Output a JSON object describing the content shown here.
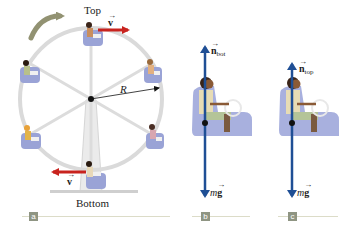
{
  "figure": {
    "panel_a": {
      "tag": "a",
      "top_label": "Top",
      "bottom_label": "Bottom",
      "radius_label": "R",
      "velocity_top_label": "v",
      "velocity_bottom_label": "v"
    },
    "panel_b": {
      "tag": "b",
      "normal_force_label": "n",
      "normal_force_subscript": "bot",
      "weight_label_m": "m",
      "weight_label_g": "g"
    },
    "panel_c": {
      "tag": "c",
      "normal_force_label": "n",
      "normal_force_subscript": "top",
      "weight_label_m": "m",
      "weight_label_g": "g"
    },
    "colors": {
      "velocity_arrow": "#c8231e",
      "force_arrow": "#1f4f95",
      "wheel": "#d9d9d9",
      "seat": "#9aa3d6",
      "rotation_arrow": "#7f7f5a",
      "panel_tag": "#8f9583"
    }
  }
}
